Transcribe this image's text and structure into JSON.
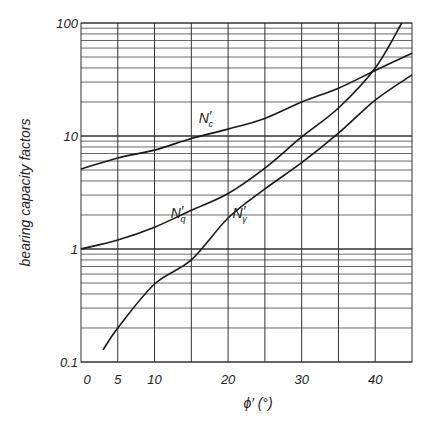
{
  "chart_data": {
    "type": "line",
    "title": "",
    "xlabel": "ϕ′ (°)",
    "ylabel": "bearing capacity factors",
    "xlim": [
      0,
      45
    ],
    "ylim": [
      0.1,
      100
    ],
    "yscale": "log",
    "grid": true,
    "x_ticks": [
      0,
      5,
      10,
      20,
      30,
      40
    ],
    "x_tick_labels": [
      "0",
      "5",
      "10",
      "20",
      "30",
      "40"
    ],
    "x_grid": [
      5,
      10,
      15,
      20,
      25,
      30,
      35,
      40
    ],
    "y_ticks": [
      0.1,
      1,
      10,
      100
    ],
    "y_tick_labels": [
      "0.1",
      "1",
      "10",
      "100"
    ],
    "legend": "none (inline curve labels)",
    "series": [
      {
        "name": "N′c",
        "label_main": "N",
        "label_prime": "′",
        "label_sub": "c",
        "label_at": [
          16,
          13
        ],
        "x": [
          0,
          5,
          10,
          15,
          20,
          25,
          30,
          35,
          40,
          45
        ],
        "y": [
          5.1,
          6.4,
          7.5,
          9.5,
          11.5,
          14.3,
          20,
          26.5,
          38,
          54
        ]
      },
      {
        "name": "N′q",
        "label_main": "N",
        "label_prime": "′",
        "label_sub": "q",
        "label_at": [
          12.2,
          1.9
        ],
        "x": [
          0,
          5,
          10,
          15,
          20,
          25,
          30,
          35,
          40,
          43.6
        ],
        "y": [
          1.0,
          1.2,
          1.56,
          2.2,
          3.1,
          5.2,
          9.8,
          17.7,
          40,
          100
        ]
      },
      {
        "name": "N′γ",
        "label_main": "N",
        "label_prime": "′",
        "label_sub": "γ",
        "label_at": [
          20.6,
          1.9
        ],
        "x": [
          3,
          5,
          10,
          15,
          20,
          25,
          30,
          35,
          40,
          45
        ],
        "y": [
          0.128,
          0.2,
          0.49,
          0.8,
          1.88,
          3.4,
          5.8,
          10.6,
          20.8,
          34.7
        ]
      }
    ]
  }
}
